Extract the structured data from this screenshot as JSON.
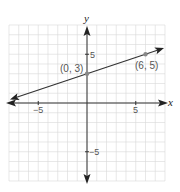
{
  "chart_data": {
    "type": "line",
    "title": "",
    "xlabel": "x",
    "ylabel": "y",
    "xlim": [
      -8,
      8
    ],
    "ylim": [
      -8,
      8
    ],
    "grid": true,
    "x_ticks_labeled": [
      "-5",
      "5"
    ],
    "y_ticks_labeled": [
      "5",
      "-5"
    ],
    "series": [
      {
        "name": "line",
        "equation": "y = (1/3)x + 3",
        "points": [
          {
            "x": 0,
            "y": 3,
            "label": "(0, 3)"
          },
          {
            "x": 6,
            "y": 5,
            "label": "(6, 5)"
          }
        ],
        "extends_both_directions": true
      }
    ]
  },
  "labels": {
    "x_axis": "x",
    "y_axis": "y",
    "x_tick_neg": "−5",
    "x_tick_pos": "5",
    "y_tick_pos": "5",
    "y_tick_neg": "−5",
    "point1": "(0, 3)",
    "point2": "(6, 5)"
  },
  "colors": {
    "grid": "#d8d8d8",
    "axis": "#333333",
    "line": "#333333",
    "point": "#888888"
  }
}
